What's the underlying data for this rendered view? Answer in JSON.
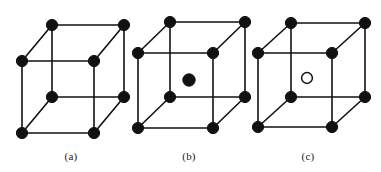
{
  "figure": {
    "title": "",
    "background_color": "#ffffff",
    "line_color": "#111111",
    "atom_fill_color": "#111111",
    "atom_hollow_fill_color": "#ffffff",
    "panels": [
      {
        "id": "a",
        "label": "(a)",
        "label_x": 71,
        "label_y": 160,
        "lattice_name": "simple-cubic",
        "origin_x": 22,
        "origin_y": 61,
        "side": 72,
        "depth_x": 30,
        "depth_y": -36,
        "corner_radius": 5.6,
        "corner_count": 8,
        "center_atom": null
      },
      {
        "id": "b",
        "label": "(b)",
        "label_x": 189,
        "label_y": 160,
        "lattice_name": "body-centered-cubic-filled",
        "origin_x": 138,
        "origin_y": 53,
        "side": 75,
        "depth_x": 32,
        "depth_y": -31,
        "corner_radius": 5.6,
        "corner_count": 8,
        "center_atom": {
          "style": "filled",
          "cx": 189,
          "cy": 80,
          "r": 6.2
        }
      },
      {
        "id": "c",
        "label": "(c)",
        "label_x": 308,
        "label_y": 160,
        "lattice_name": "body-centered-cubic-hollow",
        "origin_x": 258,
        "origin_y": 53,
        "side": 74,
        "depth_x": 33,
        "depth_y": -30,
        "corner_radius": 5.6,
        "corner_count": 8,
        "center_atom": {
          "style": "hollow",
          "cx": 307,
          "cy": 78,
          "r": 5.4
        }
      }
    ]
  }
}
